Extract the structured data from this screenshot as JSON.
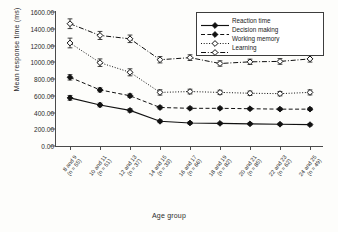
{
  "chart_data": {
    "type": "line",
    "title": "",
    "xlabel": "Age group",
    "ylabel": "Mean response time (ms)",
    "ylim": [
      0,
      1600
    ],
    "ytick_step": 200,
    "ytick_labels": [
      "1600.00",
      "1400.00",
      "1200.00",
      "1000.00",
      "800.00",
      "600.00",
      "400.00",
      "200.00",
      "0.00"
    ],
    "ytick_values": [
      1600,
      1400,
      1200,
      1000,
      800,
      600,
      400,
      200,
      0
    ],
    "grid": false,
    "legend_position": "top-right",
    "errorbars": true,
    "categories": [
      "8 and 9\n(n = 55)",
      "10 and 11\n(n = 51)",
      "12 and 13\n(n = 37)",
      "14 and 15\n(n = 33)",
      "16 and 17\n(n = 66)",
      "18 and 19\n(n = 82)",
      "20 and 21\n(n = 85)",
      "22 and 23\n(n = 62)",
      "24 and 25\n(n = 49)"
    ],
    "category_lines": [
      [
        "8 and 9",
        "(n = 55)"
      ],
      [
        "10 and 11",
        "(n = 51)"
      ],
      [
        "12 and 13",
        "(n = 37)"
      ],
      [
        "14 and 15",
        "(n = 33)"
      ],
      [
        "16 and 17",
        "(n = 66)"
      ],
      [
        "18 and 19",
        "(n = 82)"
      ],
      [
        "20 and 21",
        "(n = 85)"
      ],
      [
        "22 and 23",
        "(n = 62)"
      ],
      [
        "24 and 25",
        "(n = 49)"
      ]
    ],
    "series": [
      {
        "name": "Reaction time",
        "marker": "filled-diamond",
        "linestyle": "solid",
        "values": [
          575,
          490,
          425,
          295,
          275,
          270,
          265,
          260,
          255
        ],
        "errors": [
          28,
          22,
          20,
          16,
          14,
          12,
          12,
          12,
          14
        ]
      },
      {
        "name": "Decision making",
        "marker": "filled-diamond",
        "linestyle": "dashed",
        "values": [
          820,
          670,
          600,
          460,
          450,
          450,
          445,
          440,
          440
        ],
        "errors": [
          32,
          24,
          22,
          18,
          16,
          14,
          14,
          14,
          16
        ]
      },
      {
        "name": "Working memory",
        "marker": "open-diamond",
        "linestyle": "dotted",
        "values": [
          1230,
          995,
          880,
          640,
          650,
          640,
          630,
          625,
          640
        ],
        "errors": [
          58,
          45,
          42,
          32,
          28,
          26,
          26,
          26,
          30
        ]
      },
      {
        "name": "Learning",
        "marker": "open-diamond",
        "linestyle": "dashdot",
        "values": [
          1460,
          1320,
          1280,
          1030,
          1055,
          985,
          1005,
          1010,
          1040
        ],
        "errors": [
          58,
          48,
          45,
          38,
          34,
          32,
          32,
          34,
          38
        ]
      }
    ]
  },
  "legend": {
    "items": [
      {
        "label": "Reaction time"
      },
      {
        "label": "Decision making"
      },
      {
        "label": "Working memory"
      },
      {
        "label": "Learning"
      }
    ]
  },
  "colors": {
    "axis": "#4a4a4a",
    "ink": "#1a1a1a",
    "background": "#fdfdfb"
  }
}
